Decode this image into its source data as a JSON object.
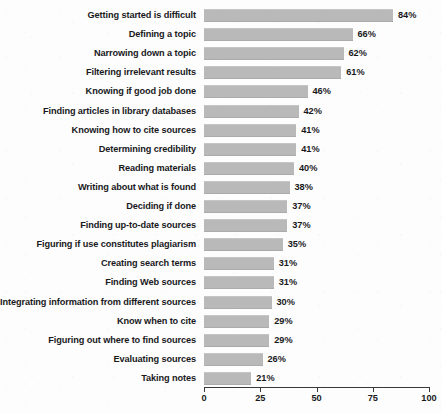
{
  "chart_data": {
    "type": "bar",
    "orientation": "horizontal",
    "title": "",
    "subtitle": "",
    "xlabel": "",
    "ylabel": "",
    "xlim": [
      0,
      100
    ],
    "xticks": [
      0,
      25,
      50,
      75,
      100
    ],
    "xtick_labels": [
      "0",
      "25",
      "50",
      "75",
      "100"
    ],
    "grid": false,
    "legend": null,
    "value_suffix": "%",
    "bar_color": "#b9b9b9",
    "axis_color": "#39393c",
    "text_color": "#19191c",
    "background_color": "#fdfdfd",
    "categories": [
      "Getting started is difficult",
      "Defining a topic",
      "Narrowing down a topic",
      "Filtering irrelevant results",
      "Knowing if good job done",
      "Finding articles in library databases",
      "Knowing how to cite sources",
      "Determining credibility",
      "Reading materials",
      "Writing about what is found",
      "Deciding if done",
      "Finding up-to-date sources",
      "Figuring if use constitutes plagiarism",
      "Creating search terms",
      "Finding Web sources",
      "Integrating information from different sources",
      "Know when to cite",
      "Figuring out where to find sources",
      "Evaluating sources",
      "Taking notes"
    ],
    "values": [
      84,
      66,
      62,
      61,
      46,
      42,
      41,
      41,
      40,
      38,
      37,
      37,
      35,
      31,
      31,
      30,
      29,
      29,
      26,
      21
    ],
    "value_labels": [
      "84%",
      "66%",
      "62%",
      "61%",
      "46%",
      "42%",
      "41%",
      "41%",
      "40%",
      "38%",
      "37%",
      "37%",
      "35%",
      "31%",
      "31%",
      "30%",
      "29%",
      "29%",
      "26%",
      "21%"
    ]
  }
}
